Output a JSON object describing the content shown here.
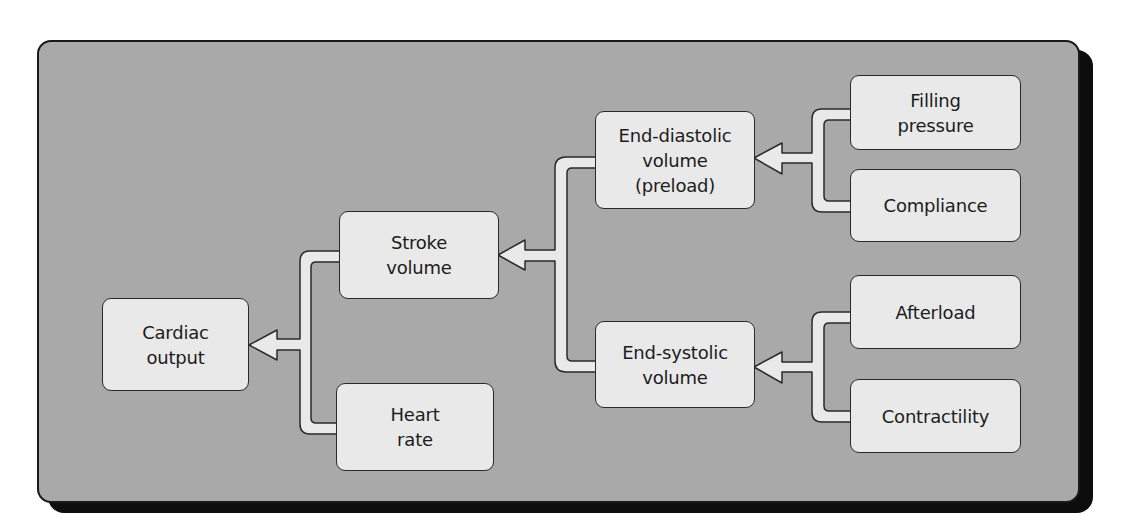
{
  "diagram": {
    "type": "flow-hierarchy",
    "colors": {
      "panel_fill": "#a9a9a9",
      "panel_border": "#1a1a1a",
      "panel_shadow": "#0d0d0d",
      "node_fill": "#e9e9e9",
      "node_border": "#2a2a2a",
      "connector_fill": "#e9e9e9",
      "text": "#1c1c1c"
    },
    "nodes": {
      "cardiac_output": "Cardiac\noutput",
      "stroke_volume": "Stroke\nvolume",
      "heart_rate": "Heart\nrate",
      "end_diastolic_volume": "End-diastolic\nvolume\n(preload)",
      "end_systolic_volume": "End-systolic\nvolume",
      "filling_pressure": "Filling\npressure",
      "compliance": "Compliance",
      "afterload": "Afterload",
      "contractility": "Contractility"
    },
    "edges": [
      {
        "from": [
          "stroke_volume",
          "heart_rate"
        ],
        "to": "cardiac_output"
      },
      {
        "from": [
          "end_diastolic_volume",
          "end_systolic_volume"
        ],
        "to": "stroke_volume"
      },
      {
        "from": [
          "filling_pressure",
          "compliance"
        ],
        "to": "end_diastolic_volume"
      },
      {
        "from": [
          "afterload",
          "contractility"
        ],
        "to": "end_systolic_volume"
      }
    ]
  }
}
